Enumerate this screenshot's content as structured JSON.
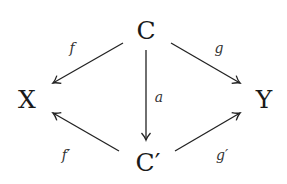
{
  "diagram": {
    "type": "commutative-diagram",
    "nodes": {
      "C": "C",
      "X": "X",
      "Y": "Y",
      "Cp": "C′"
    },
    "edges": {
      "f": "f",
      "g": "g",
      "a": "a",
      "fp": "f′",
      "gp": "g′"
    },
    "edge_list": [
      {
        "from": "C",
        "to": "X",
        "label": "f"
      },
      {
        "from": "C",
        "to": "Y",
        "label": "g"
      },
      {
        "from": "C",
        "to": "C′",
        "label": "a"
      },
      {
        "from": "C′",
        "to": "X",
        "label": "f′"
      },
      {
        "from": "C′",
        "to": "Y",
        "label": "g′"
      }
    ]
  }
}
